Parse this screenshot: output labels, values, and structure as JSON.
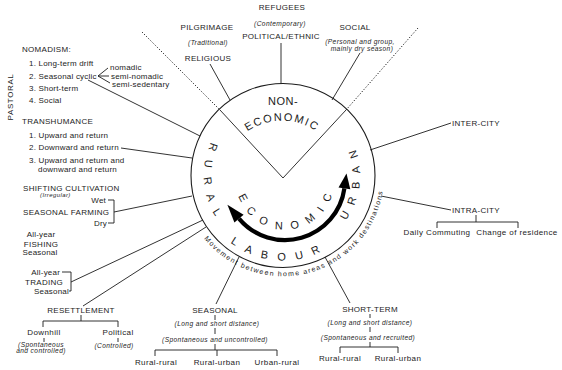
{
  "center": {
    "non_economic_line1": "NON-",
    "non_economic_line2": "ECONOMIC",
    "rural": "RURAL",
    "urban": "URBAN",
    "economic": "ECONOMIC",
    "labour": "LABOUR",
    "ring_caption": "Movement between home areas and work destinations"
  },
  "top": {
    "refugees": {
      "title": "REFUGEES",
      "note": "(Contemporary)",
      "sub": "POLITICAL/ETHNIC"
    },
    "pilgrimage": {
      "title": "PILGRIMAGE",
      "note": "(Traditional)",
      "sub": "RELIGIOUS"
    },
    "social": {
      "title": "SOCIAL",
      "note_line1": "(Personal and group,",
      "note_line2": "mainly dry season)"
    }
  },
  "left": {
    "pastoral_label": "PASTORAL",
    "nomadism": {
      "title": "NOMADISM:",
      "items": [
        "1. Long-term drift",
        "2. Seasonal cyclic",
        "3. Short-term",
        "4. Social"
      ],
      "subtypes": [
        "nomadic",
        "semi-nomadic",
        "semi-sedentary"
      ]
    },
    "transhumance": {
      "title": "TRANSHUMANCE",
      "items": [
        "1. Upward and return",
        "2. Downward and return",
        "3. Upward and return and",
        "downward and return"
      ]
    },
    "shifting_cultivation": {
      "title": "SHIFTING CULTIVATION",
      "note": "(Irregular)"
    },
    "seasonal_farming": {
      "title": "SEASONAL FARMING",
      "wet": "Wet",
      "dry": "Dry"
    },
    "fishing": {
      "all_year": "All-year",
      "title": "FISHING",
      "seasonal": "Seasonal"
    },
    "trading": {
      "all_year": "All-year",
      "title": "TRADING",
      "seasonal": "Seasonal"
    }
  },
  "bottom": {
    "resettlement": {
      "title": "RESETTLEMENT",
      "downhill": {
        "label": "Downhill",
        "note_line1": "(Spontaneous",
        "note_line2": "and controlled)"
      },
      "political": {
        "label": "Political",
        "note": "(Controlled)"
      }
    },
    "seasonal": {
      "title": "SEASONAL",
      "note1": "(Long and short distance)",
      "note2": "(Spontaneous and uncontrolled)",
      "types": [
        "Rural-rural",
        "Rural-urban",
        "Urban-rural"
      ]
    },
    "short_term": {
      "title": "SHORT-TERM",
      "note1": "(Long and short distance)",
      "note2": "(Spontaneous and recruited)",
      "types": [
        "Rural-rural",
        "Rural-urban"
      ]
    }
  },
  "right": {
    "inter_city": "INTER-CITY",
    "intra_city": {
      "title": "INTRA-CITY",
      "types": [
        "Daily Commuting",
        "Change of residence"
      ]
    }
  },
  "colors": {
    "ink": "#1c1c1c",
    "arrow": "#000000",
    "background": "#ffffff"
  }
}
